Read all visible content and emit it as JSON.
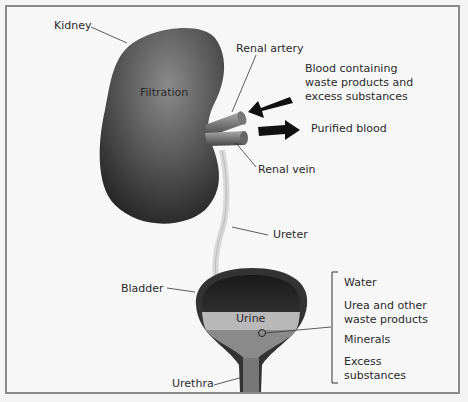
{
  "diagram": {
    "labels": {
      "kidney": "Kidney",
      "filtration": "Filtration",
      "renal_artery": "Renal artery",
      "blood_in_line1": "Blood containing",
      "blood_in_line2": "waste products and",
      "blood_in_line3": "excess substances",
      "purified_blood": "Purified blood",
      "renal_vein": "Renal vein",
      "ureter": "Ureter",
      "bladder": "Bladder",
      "urine": "Urine",
      "urethra": "Urethra"
    },
    "urine_components": [
      {
        "line1": "Water",
        "line2": ""
      },
      {
        "line1": "Urea and other",
        "line2": "waste products"
      },
      {
        "line1": "Minerals",
        "line2": ""
      },
      {
        "line1": "Excess",
        "line2": "substances"
      }
    ],
    "colors": {
      "organ_dark": "#2b2b2b",
      "organ_mid": "#6a6a6a",
      "urine_band": "#b8b8b8",
      "arrow": "#111111",
      "frame": "#8a8a8a"
    }
  }
}
